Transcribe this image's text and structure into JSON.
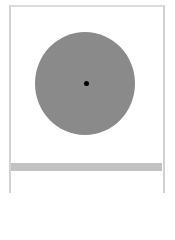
{
  "diagram": {
    "type": "circle-with-center-point",
    "frame": {
      "border_color": "#d2d2d2",
      "background": "#ffffff"
    },
    "disc": {
      "fill": "#8a8a8a",
      "shape": "circle"
    },
    "center_point": {
      "fill": "#000000",
      "shape": "dot"
    },
    "divider_bar": {
      "fill": "#c2c2c2"
    }
  }
}
